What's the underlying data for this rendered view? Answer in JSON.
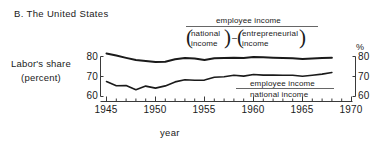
{
  "panel": {
    "title": "B. The United States"
  },
  "axes": {
    "ylabel_line1": "Labor's share",
    "ylabel_line2": "(percent)",
    "xlabel": "year",
    "right_unit": "%",
    "yticks": [
      "80",
      "70",
      "60"
    ],
    "yticks_right": [
      "80",
      "70",
      "60"
    ],
    "xticks": [
      "1945",
      "1950",
      "1955",
      "1960",
      "1965",
      "1970"
    ],
    "ylim": [
      58,
      84
    ],
    "xlim": [
      1944,
      1970
    ]
  },
  "annotations": {
    "upper": {
      "numerator": "employee income",
      "denominator_left_line1": "national",
      "denominator_left_line2": "income",
      "operator": "–",
      "denominator_right_line1": "entrepreneurial",
      "denominator_right_line2": "income"
    },
    "lower": {
      "numerator": "employee income",
      "denominator": "national income"
    }
  },
  "colors": {
    "line": "#1a1a1a",
    "axis": "#3a3a3a",
    "text": "#1a1a1a"
  },
  "chart_data": {
    "type": "line",
    "title": "B. The United States",
    "xlabel": "year",
    "ylabel": "Labor's share (percent)",
    "right_axis_label": "%",
    "xlim": [
      1944,
      1970
    ],
    "ylim": [
      58,
      84
    ],
    "grid": false,
    "legend_position": "inline-annotation",
    "x": [
      1945,
      1946,
      1947,
      1948,
      1949,
      1950,
      1951,
      1952,
      1953,
      1954,
      1955,
      1956,
      1957,
      1958,
      1959,
      1960,
      1961,
      1962,
      1963,
      1964,
      1965,
      1966,
      1967,
      1968
    ],
    "series": [
      {
        "name": "employee income / (national income - entrepreneurial income)",
        "label": "employee income over national income minus entrepreneurial income",
        "values": [
          81.5,
          80.5,
          79.3,
          78.2,
          77.8,
          77.2,
          77.4,
          78.6,
          79.3,
          79.0,
          78.2,
          79.1,
          79.2,
          79.4,
          79.2,
          79.8,
          79.6,
          79.4,
          79.3,
          79.1,
          78.8,
          79.0,
          79.3,
          79.4
        ]
      },
      {
        "name": "employee income / national income",
        "label": "employee income over national income",
        "values": [
          67.5,
          65.4,
          65.5,
          63.4,
          65.2,
          64.2,
          65.3,
          67.3,
          68.4,
          68.1,
          68.2,
          69.6,
          69.9,
          70.6,
          70.2,
          71.0,
          70.7,
          70.7,
          70.6,
          70.6,
          70.1,
          70.6,
          71.2,
          72.0
        ]
      }
    ]
  }
}
